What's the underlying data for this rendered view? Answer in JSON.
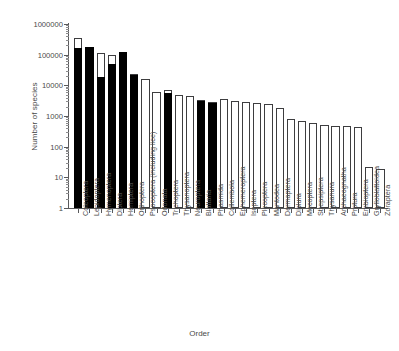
{
  "chart_data": {
    "type": "bar",
    "title": "",
    "xlabel": "Order",
    "ylabel": "Number of species",
    "yscale": "log",
    "ylim": [
      1,
      1000000
    ],
    "ytick_labels": [
      "1000000",
      "100000",
      "10000",
      "1000",
      "100",
      "10",
      "1"
    ],
    "ytick_values": [
      1000000,
      100000,
      10000,
      1000,
      100,
      10,
      1
    ],
    "grid": false,
    "legend": "none",
    "categories": [
      "Coleoptera",
      "Lepidoptera",
      "Hymenoptera",
      "Diptera",
      "Hemiptera",
      "Orthoptera",
      "Psocoptera (including lice)",
      "Odonata",
      "Trichoptera",
      "Thysanoptera",
      "Neuroptera",
      "Blattaria",
      "Phasmida",
      "Collembola",
      "Ephemeroptera",
      "Isoptera",
      "Plecoptera",
      "Mantodea",
      "Dermaptera",
      "Diplura",
      "Mecoptera",
      "Strepsiptera",
      "Thysanura",
      "Archaeognatha",
      "Protura",
      "Embioptera",
      "Grylloblattoidea",
      "Zoraptera"
    ],
    "series": [
      {
        "name": "Described species",
        "fill": "#000000",
        "values": [
          160000,
          175000,
          19000,
          50000,
          120000,
          21000,
          null,
          null,
          5500,
          null,
          null,
          3000,
          2700,
          null,
          null,
          null,
          null,
          null,
          null,
          null,
          null,
          null,
          null,
          null,
          null,
          null,
          null,
          null
        ]
      },
      {
        "name": "Estimated total species",
        "fill": "#ffffff",
        "values": [
          350000,
          180000,
          110000,
          100000,
          125000,
          23000,
          16000,
          6000,
          6800,
          5000,
          4500,
          3400,
          2800,
          3500,
          3000,
          2900,
          2700,
          2500,
          1800,
          800,
          700,
          600,
          500,
          480,
          470,
          450,
          22,
          19
        ]
      }
    ]
  }
}
